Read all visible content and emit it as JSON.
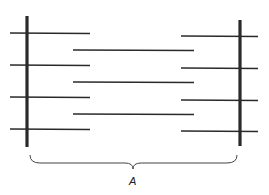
{
  "diagram": {
    "type": "sarcomere-schematic",
    "colors": {
      "line": "#2a2a2a",
      "background": "#ffffff"
    },
    "z_lines": [
      {
        "x": 27,
        "y1": 16,
        "y2": 147
      },
      {
        "x": 240,
        "y1": 20,
        "y2": 146
      }
    ],
    "left_thin_filaments": [
      {
        "x1": 10,
        "x2": 90,
        "y": 33
      },
      {
        "x1": 10,
        "x2": 90,
        "y": 65
      },
      {
        "x1": 10,
        "x2": 90,
        "y": 97
      },
      {
        "x1": 10,
        "x2": 90,
        "y": 129
      }
    ],
    "right_thin_filaments": [
      {
        "x1": 181,
        "x2": 258,
        "y": 36
      },
      {
        "x1": 181,
        "x2": 258,
        "y": 68
      },
      {
        "x1": 181,
        "x2": 258,
        "y": 100
      },
      {
        "x1": 181,
        "x2": 258,
        "y": 131
      }
    ],
    "thick_filaments": [
      {
        "x1": 73,
        "x2": 194,
        "y": 50
      },
      {
        "x1": 73,
        "x2": 194,
        "y": 82
      },
      {
        "x1": 73,
        "x2": 194,
        "y": 114
      }
    ],
    "brace": {
      "x1": 30,
      "x2": 237,
      "y": 163,
      "tip_x": 133
    },
    "brace_label": "A"
  }
}
